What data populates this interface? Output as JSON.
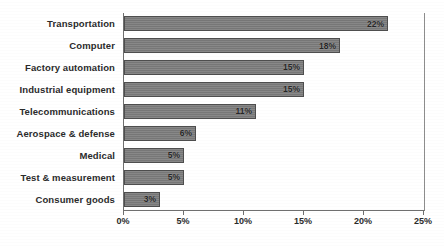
{
  "chart_data": {
    "type": "bar",
    "orientation": "horizontal",
    "title": "",
    "xlabel": "",
    "ylabel": "",
    "categories": [
      "Transportation",
      "Computer",
      "Factory automation",
      "Industrial equipment",
      "Telecommunications",
      "Aerospace & defense",
      "Medical",
      "Test & measurement",
      "Consumer goods"
    ],
    "values": [
      22,
      18,
      15,
      15,
      11,
      6,
      5,
      5,
      3
    ],
    "value_labels": [
      "22%",
      "18%",
      "15%",
      "15%",
      "11%",
      "6%",
      "5%",
      "5%",
      "3%"
    ],
    "xlim": [
      0,
      25
    ],
    "xticks": [
      0,
      5,
      10,
      15,
      20,
      25
    ],
    "xtick_labels": [
      "0%",
      "5%",
      "10%",
      "15%",
      "20%",
      "25%"
    ],
    "grid": false,
    "legend": null,
    "bar_color": "#7d7d7d",
    "bar_border_color": "#4e4e4e",
    "axis_color": "#6f6f6f",
    "text_color": "#2b2b2b",
    "background": "#ffffff"
  }
}
